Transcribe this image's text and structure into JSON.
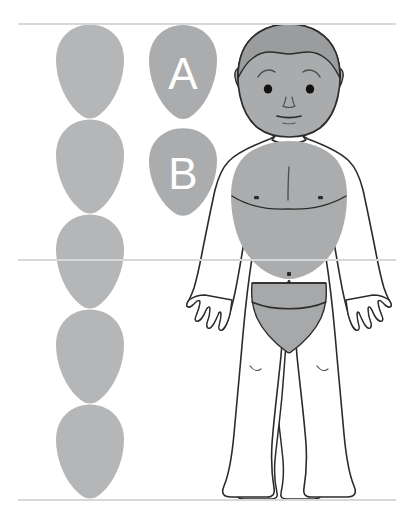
{
  "figure": {
    "background_color": "#ffffff",
    "guide_line_color": "#d6d8da",
    "outline_color": "#2b2b2b",
    "shade_color": "#a9abad",
    "skin_color": "#ffffff",
    "label_color": "#ffffff"
  },
  "guides": {
    "top_label": "",
    "middle_label": "",
    "bottom_label": "",
    "lines_y": [
      24,
      260,
      500
    ]
  },
  "head_units": {
    "count": 5,
    "column_x": 90,
    "unit_height": 95,
    "items": [
      {
        "index": 1,
        "label": ""
      },
      {
        "index": 2,
        "label": ""
      },
      {
        "index": 3,
        "label": ""
      },
      {
        "index": 4,
        "label": ""
      },
      {
        "index": 5,
        "label": ""
      }
    ]
  },
  "callouts": [
    {
      "id": "a",
      "label": "A",
      "cx": 183,
      "cy": 72
    },
    {
      "id": "b",
      "label": "B",
      "cx": 183,
      "cy": 172
    }
  ],
  "body": {
    "head_label": "head",
    "torso_label": "torso",
    "pelvis_label": "pelvis",
    "left_arm_label": "left-arm",
    "right_arm_label": "right-arm",
    "left_leg_label": "left-leg",
    "right_leg_label": "right-leg"
  }
}
